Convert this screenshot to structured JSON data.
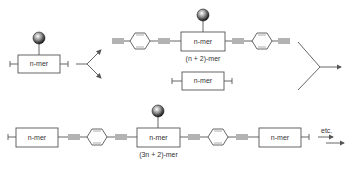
{
  "diagram": {
    "type": "reaction-scheme",
    "colors": {
      "line": "#555555",
      "box_border": "#555555",
      "text": "#333333"
    },
    "row1": {
      "start_unit": {
        "label": "n-mer",
        "end_groups": [
          "I",
          "I"
        ],
        "has_ball": true
      },
      "product_top": {
        "label": "n-mer",
        "caption": "(n + 2)-mer",
        "linkers": [
          "ethynyl-phenyl-ethynyl",
          "ethynyl-phenyl-ethynyl"
        ],
        "has_ball": true
      },
      "product_bottom": {
        "label": "n-mer",
        "end_groups": [
          "I",
          "I"
        ]
      }
    },
    "row2": {
      "units": [
        {
          "label": "n-mer",
          "end_group": "I"
        },
        {
          "label": "n-mer",
          "caption": "(3n + 2)-mer",
          "has_ball": true
        },
        {
          "label": "n-mer",
          "end_group": "I"
        }
      ],
      "continuation": "etc."
    },
    "end_group_symbol": "I"
  }
}
